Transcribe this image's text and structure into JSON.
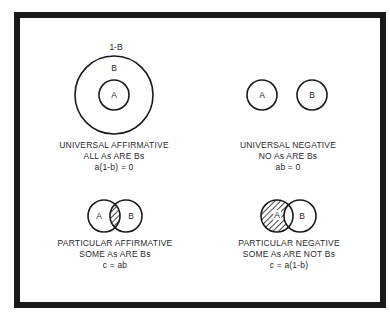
{
  "panels": [
    {
      "id": "universal-affirmative",
      "title": "UNIVERSAL AFFIRMATIVE",
      "statement": "ALL As ARE Bs",
      "formula": "a(1-b) = 0",
      "labels": {
        "outer": "1-B",
        "b": "B",
        "a": "A"
      }
    },
    {
      "id": "universal-negative",
      "title": "UNIVERSAL NEGATIVE",
      "statement": "NO As ARE Bs",
      "formula": "ab = 0",
      "labels": {
        "a": "A",
        "b": "B"
      }
    },
    {
      "id": "particular-affirmative",
      "title": "PARTICULAR AFFIRMATIVE",
      "statement": "SOME As ARE Bs",
      "formula": "c = ab",
      "labels": {
        "a": "A",
        "b": "B"
      }
    },
    {
      "id": "particular-negative",
      "title": "PARTICULAR NEGATIVE",
      "statement": "SOME As ARE NOT Bs",
      "formula": "c = a(1-b)",
      "labels": {
        "a": "A",
        "b": "B"
      }
    }
  ],
  "colors": {
    "line": "#1a1a1a",
    "border": "#1a1a1a",
    "background": "#ffffff"
  }
}
